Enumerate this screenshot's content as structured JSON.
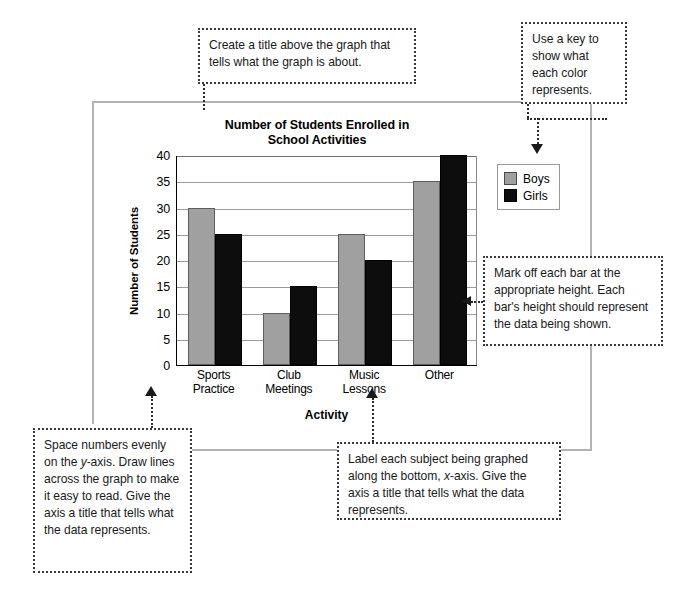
{
  "chart_data": {
    "type": "bar",
    "title": "Number of Students Enrolled in School Activities",
    "title_line1": "Number of Students Enrolled in",
    "title_line2": "School Activities",
    "xlabel": "Activity",
    "ylabel": "Number of Students",
    "ylim": [
      0,
      40
    ],
    "yticks": [
      0,
      5,
      10,
      15,
      20,
      25,
      30,
      35,
      40
    ],
    "grid": true,
    "legend_position": "right-outside",
    "categories": [
      "Sports Practice",
      "Club Meetings",
      "Music Lessons",
      "Other"
    ],
    "category_lines": [
      [
        "Sports",
        "Practice"
      ],
      [
        "Club",
        "Meetings"
      ],
      [
        "Music",
        "Lessons"
      ],
      [
        "Other",
        ""
      ]
    ],
    "series": [
      {
        "name": "Boys",
        "color": "#a0a0a0",
        "values": [
          30,
          10,
          25,
          35
        ]
      },
      {
        "name": "Girls",
        "color": "#0d0d0d",
        "values": [
          25,
          15,
          20,
          40
        ]
      }
    ]
  },
  "legend": {
    "items": [
      {
        "label": "Boys",
        "color": "#a0a0a0"
      },
      {
        "label": "Girls",
        "color": "#0d0d0d"
      }
    ]
  },
  "callouts": {
    "title_note": "Create a title above the graph that tells what the graph is about.",
    "key_note": "Use a key to show what each color represents.",
    "bars_note": "Mark off each bar at the appropriate height. Each bar's height should represent the data being shown.",
    "yaxis_note_part1": "Space numbers evenly on the ",
    "yaxis_note_italic": "y",
    "yaxis_note_part2": "-axis. Draw lines across the graph to make it easy to read. Give the axis a title that tells what the data represents.",
    "xaxis_note_part1": "Label each subject being graphed along the bottom, ",
    "xaxis_note_italic": "x",
    "xaxis_note_part2": "-axis. Give the axis a title that tells what the data represents."
  },
  "colors": {
    "boys": "#a0a0a0",
    "girls": "#0d0d0d",
    "frame": "#b3b3b3",
    "callout_border": "#3a3a3a"
  }
}
